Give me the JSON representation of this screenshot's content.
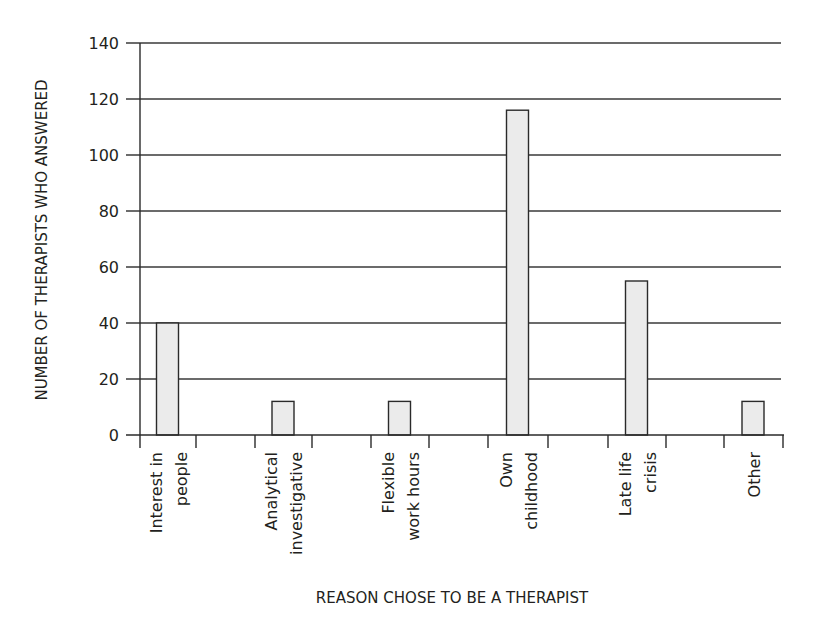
{
  "chart_data": {
    "type": "bar",
    "title": "",
    "xlabel": "REASON CHOSE TO BE A THERAPIST",
    "ylabel": "NUMBER OF THERAPISTS WHO ANSWERED",
    "ylim": [
      0,
      140
    ],
    "yticks": [
      0,
      20,
      40,
      60,
      80,
      100,
      120,
      140
    ],
    "grid": true,
    "legend": null,
    "categories": [
      [
        "Interest in",
        "people"
      ],
      [
        "Analytical",
        "investigative"
      ],
      [
        "Flexible",
        "work hours"
      ],
      [
        "Own",
        "childhood"
      ],
      [
        "Late life",
        "crisis"
      ],
      [
        "Other"
      ]
    ],
    "category_labels": [
      "Interest in people",
      "Analytical investigative",
      "Flexible work hours",
      "Own childhood",
      "Late life crisis",
      "Other"
    ],
    "values": [
      40,
      12,
      12,
      116,
      55,
      12
    ],
    "colors": {
      "bar_fill": "#ebebeb",
      "bar_stroke": "#2a2a2a",
      "grid": "#3a3a3a",
      "text": "#231f20"
    }
  }
}
